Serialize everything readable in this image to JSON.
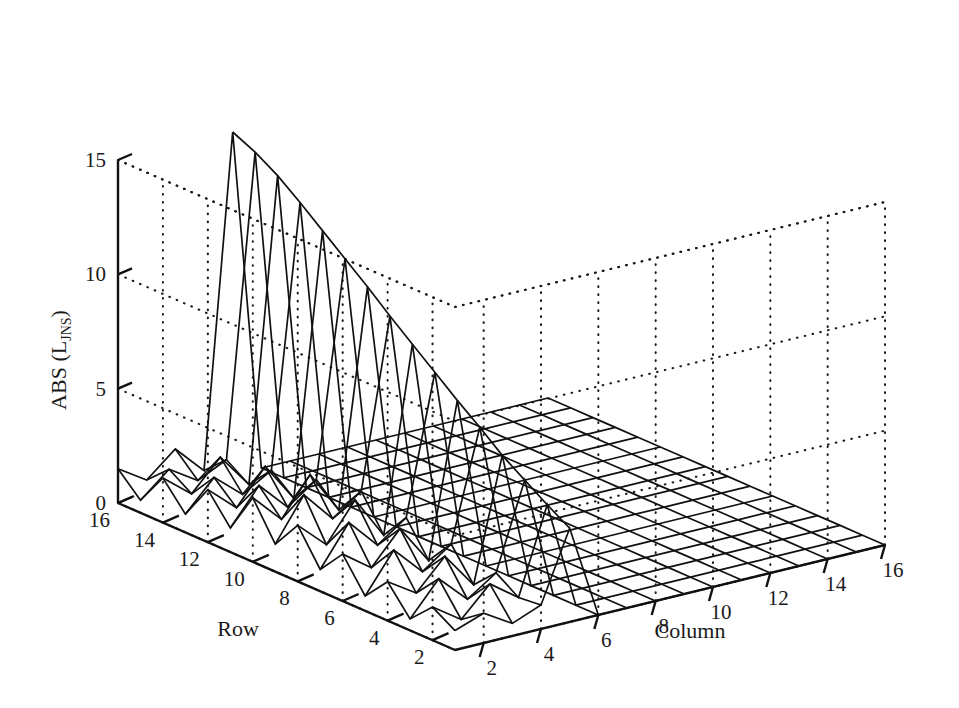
{
  "figure": {
    "kind": "3d-mesh-surface-plot",
    "background_color": "#ffffff",
    "line_color": "#111111",
    "grid_color": "#1a1a1a"
  },
  "labels": {
    "z_axis_main": "ABS (L",
    "z_axis_sub": "JNS",
    "z_axis_close": ")",
    "z_axis_full": "ABS (L_JNS)",
    "row_axis_title": "Row",
    "column_axis_title": "Column"
  },
  "chart_data": {
    "type": "surface",
    "title": "",
    "xlabel": "Row",
    "ylabel": "Column",
    "zlabel": "ABS (L_JNS)",
    "grid": true,
    "legend": "none",
    "row_ticks": [
      16,
      14,
      12,
      10,
      8,
      6,
      4,
      2
    ],
    "column_ticks": [
      2,
      4,
      6,
      8,
      10,
      12,
      14,
      16
    ],
    "z_ticks": [
      0,
      5,
      10,
      15
    ],
    "xlim": [
      1,
      16
    ],
    "ylim": [
      1,
      16
    ],
    "zlim": [
      0,
      15
    ],
    "row_values": [
      1,
      2,
      3,
      4,
      5,
      6,
      7,
      8,
      9,
      10,
      11,
      12,
      13,
      14,
      15,
      16
    ],
    "column_values": [
      1,
      2,
      3,
      4,
      5,
      6,
      7,
      8,
      9,
      10,
      11,
      12,
      13,
      14,
      15,
      16
    ],
    "z_values": [
      [
        0.85,
        1.3,
        0.55,
        1.05,
        4.1,
        0,
        0,
        0,
        0,
        0,
        0,
        0,
        0,
        0,
        0,
        0
      ],
      [
        1.45,
        0.6,
        1.85,
        0.95,
        4.7,
        0,
        0,
        0,
        0,
        0,
        0,
        0,
        0,
        0,
        0,
        0
      ],
      [
        0.5,
        1.95,
        0.75,
        1.6,
        5.35,
        0,
        0,
        0,
        0,
        0,
        0,
        0,
        0,
        0,
        0,
        0
      ],
      [
        1.7,
        0.9,
        2.2,
        0.65,
        6.0,
        0,
        0,
        0,
        0,
        0,
        0,
        0,
        0,
        0,
        0,
        0
      ],
      [
        0.65,
        2.35,
        1.1,
        2.0,
        6.8,
        0,
        0,
        0,
        0,
        0,
        0,
        0,
        0,
        0,
        0,
        0
      ],
      [
        2.05,
        1.15,
        2.55,
        0.85,
        7.55,
        0,
        0,
        0,
        0,
        0,
        0,
        0,
        0,
        0,
        0,
        0
      ],
      [
        0.95,
        2.7,
        1.4,
        2.3,
        8.35,
        0,
        0,
        0,
        0,
        0,
        0,
        0,
        0,
        0,
        0,
        0
      ],
      [
        2.45,
        1.3,
        2.95,
        1.1,
        9.15,
        0,
        0,
        0,
        0,
        0,
        0,
        0,
        0,
        0,
        0,
        0
      ],
      [
        1.2,
        3.05,
        1.7,
        2.6,
        9.95,
        0,
        0,
        0,
        0,
        0,
        0,
        0,
        0,
        0,
        0,
        0
      ],
      [
        2.8,
        1.55,
        3.2,
        1.35,
        10.8,
        0,
        0,
        0,
        0,
        0,
        0,
        0,
        0,
        0,
        0,
        0
      ],
      [
        1.05,
        2.6,
        1.35,
        2.25,
        11.6,
        0,
        0,
        0,
        0,
        0,
        0,
        0,
        0,
        0,
        0,
        0
      ],
      [
        2.3,
        1.2,
        2.7,
        1.0,
        12.4,
        0,
        0,
        0,
        0,
        0,
        0,
        0,
        0,
        0,
        0,
        0
      ],
      [
        0.8,
        2.1,
        1.05,
        1.8,
        13.2,
        0,
        0,
        0,
        0,
        0,
        0,
        0,
        0,
        0,
        0,
        0
      ],
      [
        1.95,
        0.95,
        2.25,
        0.75,
        13.95,
        0,
        0,
        0,
        0,
        0,
        0,
        0,
        0,
        0,
        0,
        0
      ],
      [
        0.55,
        1.6,
        0.8,
        1.4,
        14.55,
        0,
        0,
        0,
        0,
        0,
        0,
        0,
        0,
        0,
        0,
        0
      ],
      [
        1.5,
        0.7,
        1.75,
        0.5,
        15.0,
        0,
        0,
        0,
        0,
        0,
        0,
        0,
        0,
        0,
        0,
        0
      ]
    ]
  }
}
